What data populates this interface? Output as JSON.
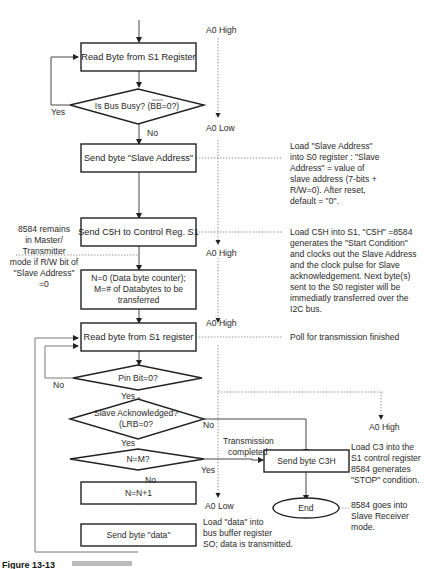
{
  "flowchart": {
    "boxes": {
      "read_s1_1": "Read Byte from S1 Register",
      "send_slave_addr": "Send byte \"Slave Address\"",
      "send_c5h": "Send C5H to Control Reg. S1",
      "init_n_m_line1": "N=0 (Data byte counter);",
      "init_n_m_line2": "M=# of Databytes to be",
      "init_n_m_line3": "transferred",
      "read_s1_2": "Read byte from S1 register",
      "n_inc": "N=N+1",
      "send_data": "Send byte \"data\"",
      "send_c3h": "Send byte C3H",
      "end": "End"
    },
    "decisions": {
      "bus_busy": "Is Bus Busy? (BB=0?)",
      "pin_bit": "Pin Bit=0?",
      "slave_ack_line1": "Slave Acknowledged?",
      "slave_ack_line2": "(LRB=0?",
      "n_eq_m": "N=M?"
    },
    "branch_labels": {
      "bus_busy_yes": "Yes",
      "bus_busy_no": "No",
      "pin_bit_no": "No",
      "pin_bit_yes": "Yes",
      "slave_ack_yes": "Yes",
      "slave_ack_no": "No",
      "n_eq_m_yes": "Yes",
      "n_eq_m_no": "No",
      "transmission_line1": "Transmission",
      "transmission_line2": "completed"
    },
    "a0_labels": {
      "a0_high_1": "A0 High",
      "a0_low_1": "A0 Low",
      "a0_high_2": "A0 High",
      "a0_high_3": "A0 High",
      "a0_high_4": "A0 High",
      "a0_low_2": "A0 Low"
    },
    "annotations": {
      "slave_address_note": [
        "Load \"Slave Address\"",
        "into S0 register : \"Slave",
        "Address\" = value of",
        "slave address (7-bits +",
        "R/W=0). After reset,",
        "default = \"0\"."
      ],
      "c5h_note": [
        "Load C5H into S1, \"C5H\" =8584",
        "generates the \"Start Condition\"",
        "and clocks out the Slave Address",
        "and the clock pulse for Slave",
        "acknowledgement. Next byte(s)",
        "sent to the S0 register will be",
        "immediatly transferred over the",
        "I2C bus."
      ],
      "master_note": [
        "8584 remains",
        "in Master/",
        "Transmitter",
        "mode if R/W bit of",
        "\"Slave Address\"",
        "=0"
      ],
      "poll_note": "Poll for transmission finished",
      "c3_note": [
        "Load C3 into the",
        "S1 control register",
        "8584 generates",
        "\"STOP\" condition."
      ],
      "end_note": [
        "8584 goes into",
        "Slave Receiver",
        "mode."
      ],
      "data_note": [
        "Load \"data\" into",
        "bus buffer register",
        "SO; data is transmitted."
      ]
    }
  },
  "caption": {
    "label": "Figure 13-13"
  }
}
